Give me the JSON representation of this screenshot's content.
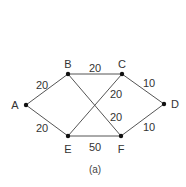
{
  "diagram": {
    "type": "weighted-graph",
    "caption": "(a)",
    "nodes": [
      {
        "id": "A",
        "label": "A",
        "x": 26,
        "y": 105,
        "lx": 15,
        "ly": 105
      },
      {
        "id": "B",
        "label": "B",
        "x": 68,
        "y": 74,
        "lx": 68,
        "ly": 64
      },
      {
        "id": "C",
        "label": "C",
        "x": 122,
        "y": 74,
        "lx": 122,
        "ly": 64
      },
      {
        "id": "D",
        "label": "D",
        "x": 164,
        "y": 104,
        "lx": 175,
        "ly": 104
      },
      {
        "id": "E",
        "label": "E",
        "x": 68,
        "y": 136,
        "lx": 68,
        "ly": 149
      },
      {
        "id": "F",
        "label": "F",
        "x": 121,
        "y": 136,
        "lx": 121,
        "ly": 149
      }
    ],
    "edges": [
      {
        "from": "A",
        "to": "B",
        "weight": "20",
        "lx": 42,
        "ly": 85
      },
      {
        "from": "A",
        "to": "E",
        "weight": "20",
        "lx": 42,
        "ly": 128
      },
      {
        "from": "B",
        "to": "C",
        "weight": "20",
        "lx": 95,
        "ly": 68
      },
      {
        "from": "C",
        "to": "D",
        "weight": "10",
        "lx": 149,
        "ly": 83
      },
      {
        "from": "D",
        "to": "F",
        "weight": "10",
        "lx": 149,
        "ly": 127
      },
      {
        "from": "E",
        "to": "F",
        "weight": "50",
        "lx": 95,
        "ly": 147
      },
      {
        "from": "C",
        "to": "E",
        "weight": "20",
        "lx": 116,
        "ly": 94
      },
      {
        "from": "B",
        "to": "F",
        "weight": "20",
        "lx": 116,
        "ly": 117
      }
    ]
  }
}
